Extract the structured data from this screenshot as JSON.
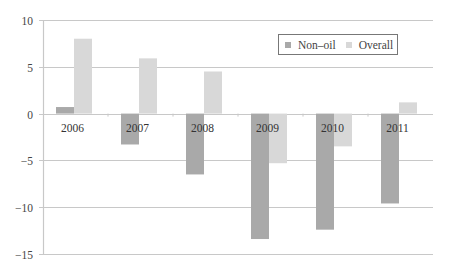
{
  "chart_data": {
    "type": "bar",
    "title": "",
    "xlabel": "",
    "ylabel": "",
    "categories": [
      "2006",
      "2007",
      "2008",
      "2009",
      "2010",
      "2011"
    ],
    "series": [
      {
        "name": "Non–oil",
        "color": "#a9a9a9",
        "values": [
          0.7,
          -3.3,
          -6.5,
          -13.4,
          -12.4,
          -9.6
        ]
      },
      {
        "name": "Overall",
        "color": "#d8d8d8",
        "values": [
          8.0,
          5.9,
          4.5,
          -5.3,
          -3.5,
          1.2
        ]
      }
    ],
    "ylim": [
      -15,
      10
    ],
    "yticks": [
      "10",
      "5",
      "0",
      "−5",
      "−10",
      "−15"
    ],
    "ytick_values": [
      10,
      5,
      0,
      -5,
      -10,
      -15
    ],
    "grid": true,
    "gridline_color": "#c8c8c8",
    "legend_position": "upper right",
    "category_labels_position": "at zero line"
  },
  "legend": {
    "items": [
      {
        "label": "Non–oil",
        "color": "#a9a9a9"
      },
      {
        "label": "Overall",
        "color": "#d8d8d8"
      }
    ]
  }
}
